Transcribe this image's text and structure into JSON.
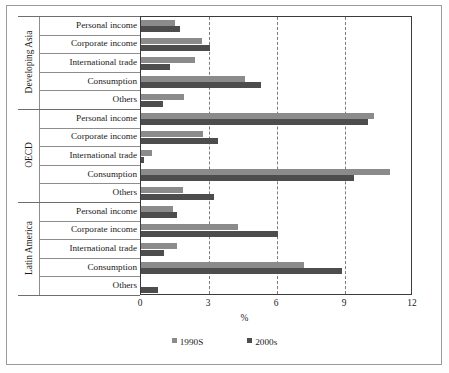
{
  "chart_data": {
    "type": "bar",
    "orientation": "horizontal",
    "title": "",
    "xlabel": "%",
    "ylabel": "",
    "xlim": [
      0,
      12
    ],
    "xticks": [
      0,
      3,
      6,
      9,
      12
    ],
    "xtick_labels": [
      "0",
      "3",
      "6",
      "9",
      "12"
    ],
    "grid": "vertical dashed at 3, 6, 9",
    "legend_position": "bottom-center",
    "legend": [
      "1990S",
      "2000s"
    ],
    "groups": [
      {
        "name": "Developing Asia",
        "categories": [
          "Personal income",
          "Corporate income",
          "International trade",
          "Consumption",
          "Others"
        ],
        "series": [
          {
            "name": "1990S",
            "values": [
              1.5,
              2.7,
              2.4,
              4.6,
              1.9
            ]
          },
          {
            "name": "2000s",
            "values": [
              1.7,
              3.05,
              1.3,
              5.3,
              0.95
            ]
          }
        ]
      },
      {
        "name": "OECD",
        "categories": [
          "Personal income",
          "Corporate income",
          "International trade",
          "Consumption",
          "Others"
        ],
        "series": [
          {
            "name": "1990S",
            "values": [
              10.3,
              2.75,
              0.5,
              11.0,
              1.85
            ]
          },
          {
            "name": "2000s",
            "values": [
              10.0,
              3.4,
              0.15,
              9.4,
              3.2
            ]
          }
        ]
      },
      {
        "name": "Latin America",
        "categories": [
          "Personal income",
          "Corporate income",
          "International trade",
          "Consumption",
          "Others"
        ],
        "series": [
          {
            "name": "1990S",
            "values": [
              1.4,
              4.3,
              1.6,
              7.2,
              0.0
            ]
          },
          {
            "name": "2000s",
            "values": [
              1.6,
              6.05,
              1.0,
              8.85,
              0.75
            ]
          }
        ]
      }
    ],
    "colors": {
      "1990S": "#8b8b8b",
      "2000s": "#4d4d4d"
    }
  }
}
